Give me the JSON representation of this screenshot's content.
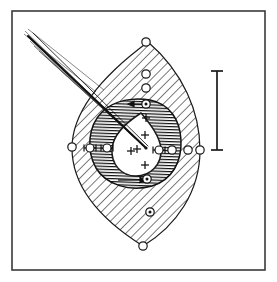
{
  "figure": {
    "domain": "Diagram",
    "width": 277,
    "height": 282,
    "background_color": "#ffffff",
    "ink_color": "#1a1a1a",
    "frame": {
      "name": "figure-border",
      "stroke_color": "#3a3a3a",
      "stroke_width": 1.6,
      "x": 12,
      "y": 11,
      "width": 253,
      "height": 259
    },
    "outer_region": {
      "name": "outer-lens-region",
      "label": "outer hatched lens",
      "fill_pattern": "diagonal-hatch-45",
      "hatch_angle_deg": 45,
      "hatch_spacing_px": 6.5,
      "stroke_color": "#1a1a1a",
      "stroke_width": 1.1,
      "apex_top": [
        148,
        42
      ],
      "apex_bottom": [
        143,
        246
      ],
      "extent_left_x": 72,
      "extent_right_x": 200
    },
    "inner_region": {
      "name": "inner-dense-hatched-ring",
      "label": "inner dense hatched ring",
      "fill_pattern": "dense-horizontal-hatch",
      "hatch_angle_deg": 0,
      "hatch_spacing_px": 3.0,
      "stroke_color": "#111111",
      "stroke_width": 1.4
    },
    "core": {
      "name": "white-teardrop-core",
      "label": "white teardrop core",
      "fill": "#ffffff",
      "stroke_color": "#1a1a1a",
      "stroke_width": 1.4
    },
    "needle": {
      "name": "needle-probe",
      "label": "needle / probe",
      "entry_point": [
        27,
        37
      ],
      "tip_point": [
        146,
        148
      ],
      "stroke_color": "#111111",
      "shaft_width": 2.0,
      "ray_count": 6,
      "ray_note": "thin converging guide lines fanning from upper-left"
    },
    "scale_bar": {
      "name": "scale-bar",
      "label": "scale bar",
      "orientation": "vertical",
      "x": 217,
      "y_top": 71,
      "y_bottom": 150,
      "length_px": 79,
      "cap_half_width": 6,
      "stroke_color": "#1a1a1a",
      "stroke_width": 1.6
    },
    "crosses": {
      "name": "cross-markers",
      "label": "plus markers in core",
      "stroke_color": "#111111",
      "arm_length": 4,
      "stroke_width": 1.2,
      "points": [
        [
          146,
          118
        ],
        [
          145,
          135
        ],
        [
          131,
          151
        ],
        [
          145,
          165
        ],
        [
          137,
          149
        ]
      ]
    },
    "circle_markers": {
      "name": "circle-markers",
      "label": "open circle landmark markers",
      "fill": "#ffffff",
      "stroke_color": "#1a1a1a",
      "stroke_width": 1.2,
      "radius": 4.2,
      "points": [
        [
          146,
          42
        ],
        [
          146,
          74
        ],
        [
          146,
          88
        ],
        [
          143,
          246
        ],
        [
          72,
          147
        ],
        [
          172,
          150
        ],
        [
          188,
          150
        ],
        [
          200,
          150
        ]
      ]
    },
    "dotted_circle_markers": {
      "name": "dotted-circle-markers",
      "label": "circle markers with filled centre",
      "fill": "#ffffff",
      "dot_color": "#111111",
      "stroke_color": "#111111",
      "radius": 4.2,
      "dot_radius": 1.5,
      "points": [
        [
          146,
          104
        ],
        [
          147,
          179
        ],
        [
          150,
          212
        ]
      ]
    },
    "tick_circle_markers": {
      "name": "tick-circle-markers",
      "label": "circle markers with horizontal tick bars",
      "fill": "#ffffff",
      "stroke_color": "#111111",
      "radius": 4.0,
      "tick_half_length": 6,
      "points": [
        [
          90,
          148
        ],
        [
          107,
          148
        ],
        [
          159,
          150
        ]
      ]
    },
    "arrow_markers": {
      "name": "arrow-markers",
      "label": "small directional arrow marks",
      "stroke_color": "#111111",
      "items": [
        {
          "from": [
            150,
            104
          ],
          "to": [
            128,
            104
          ]
        },
        {
          "from": [
            120,
            180
          ],
          "to": [
            146,
            180
          ]
        }
      ]
    }
  }
}
